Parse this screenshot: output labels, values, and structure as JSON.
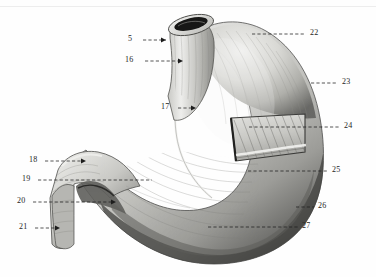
{
  "figure": {
    "domain_type": "anatomical-illustration",
    "background_color": "#fefefe",
    "ink_color": "#1d1d1d",
    "canvas": {
      "width": 376,
      "height": 277
    }
  },
  "labels": [
    {
      "id": "l5",
      "number": "5",
      "side": "left",
      "text_x": 131,
      "text_y": 37,
      "line_x1": 143,
      "line_x2": 168,
      "line_y": 40,
      "arrow": true,
      "target": "esophagus-lumen"
    },
    {
      "id": "l16",
      "number": "16",
      "side": "left",
      "text_x": 128,
      "text_y": 58,
      "line_x1": 145,
      "line_x2": 183,
      "line_y": 61,
      "arrow": true,
      "target": "esophagus-wall"
    },
    {
      "id": "l17",
      "number": "17",
      "side": "left",
      "text_x": 163,
      "text_y": 105,
      "line_x1": 178,
      "line_x2": 196,
      "line_y": 108,
      "arrow": true,
      "target": "cardiac-notch-region"
    },
    {
      "id": "l18",
      "number": "18",
      "side": "left",
      "text_x": 31,
      "text_y": 158,
      "line_x1": 45,
      "line_x2": 86,
      "line_y": 161,
      "arrow": true,
      "target": "superior-duodenum"
    },
    {
      "id": "l19",
      "number": "19",
      "side": "left",
      "text_x": 24,
      "text_y": 177,
      "line_x1": 38,
      "line_x2": 152,
      "line_y": 180,
      "arrow": false,
      "target": "lesser-curvature"
    },
    {
      "id": "l20",
      "number": "20",
      "side": "left",
      "text_x": 19,
      "text_y": 199,
      "line_x1": 33,
      "line_x2": 116,
      "line_y": 202,
      "arrow": true,
      "target": "pylorus"
    },
    {
      "id": "l21",
      "number": "21",
      "side": "left",
      "text_x": 21,
      "text_y": 225,
      "line_x1": 35,
      "line_x2": 60,
      "line_y": 228,
      "arrow": true,
      "target": "descending-duodenum"
    },
    {
      "id": "l22",
      "number": "22",
      "side": "right",
      "text_x": 312,
      "text_y": 31,
      "line_x1": 252,
      "line_x2": 306,
      "line_y": 34,
      "arrow": false,
      "target": "fundus"
    },
    {
      "id": "l23",
      "number": "23",
      "side": "right",
      "text_x": 344,
      "text_y": 80,
      "line_x1": 311,
      "line_x2": 338,
      "line_y": 83,
      "arrow": false,
      "target": "greater-curvature-upper"
    },
    {
      "id": "l24",
      "number": "24",
      "side": "right",
      "text_x": 346,
      "text_y": 124,
      "line_x1": 249,
      "line_x2": 340,
      "line_y": 127,
      "arrow": false,
      "target": "oblique-fibers-window"
    },
    {
      "id": "l25",
      "number": "25",
      "side": "right",
      "text_x": 334,
      "text_y": 168,
      "line_x1": 248,
      "line_x2": 328,
      "line_y": 171,
      "arrow": false,
      "target": "circular-muscle-layer"
    },
    {
      "id": "l26",
      "number": "26",
      "side": "right",
      "text_x": 320,
      "text_y": 204,
      "line_x1": 296,
      "line_x2": 314,
      "line_y": 207,
      "arrow": false,
      "target": "longitudinal-muscle-layer"
    },
    {
      "id": "l27",
      "number": "27",
      "side": "right",
      "text_x": 304,
      "text_y": 224,
      "line_x1": 208,
      "line_x2": 298,
      "line_y": 227,
      "arrow": false,
      "target": "greater-curvature-lower"
    }
  ],
  "structures": {
    "esophagus": "esophagus",
    "fundus": "fundus",
    "body": "body-of-stomach",
    "pylorus": "pylorus",
    "duodenum": "duodenum",
    "dissection_window": "muscle-layer-dissection-window",
    "greater_curvature": "greater-curvature",
    "lesser_curvature": "lesser-curvature"
  }
}
